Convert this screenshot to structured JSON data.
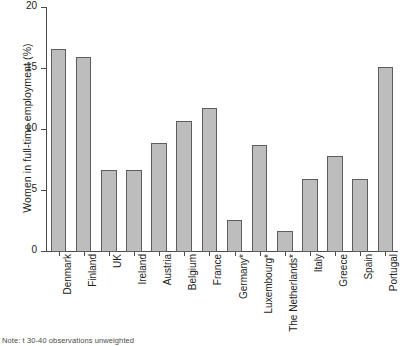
{
  "chart_data": {
    "type": "bar",
    "title": "",
    "xlabel": "",
    "ylabel": "Women in full-time employment (%)",
    "ylim": [
      0,
      20
    ],
    "yticks": [
      0,
      5,
      10,
      15,
      20
    ],
    "ytick_labels": [
      "0",
      "5",
      "10",
      "15",
      "20"
    ],
    "grid": false,
    "legend": null,
    "categories": [
      "Denmark",
      "Finland",
      "UK",
      "Ireland",
      "Austria",
      "Belgium",
      "France",
      "Germany*",
      "Luxembourg*",
      "The Netherlands*",
      "Italy",
      "Greece",
      "Spain",
      "Portugal"
    ],
    "values": [
      16.6,
      16.0,
      6.7,
      6.7,
      8.9,
      10.7,
      11.8,
      2.6,
      8.8,
      1.7,
      6.0,
      7.9,
      6.0,
      15.2
    ],
    "series": [
      {
        "name": "Women in full-time employment (%)",
        "values": [
          16.6,
          16.0,
          6.7,
          6.7,
          8.9,
          10.7,
          11.8,
          2.6,
          8.8,
          1.7,
          6.0,
          7.9,
          6.0,
          15.2
        ]
      }
    ],
    "bar_color": "#bdbdbd",
    "bar_edge_color": "#5d5d5d",
    "axis_color": "#4b4b4b"
  },
  "footnote": {
    "text": "Note: t 30-40 observations unweighted"
  }
}
